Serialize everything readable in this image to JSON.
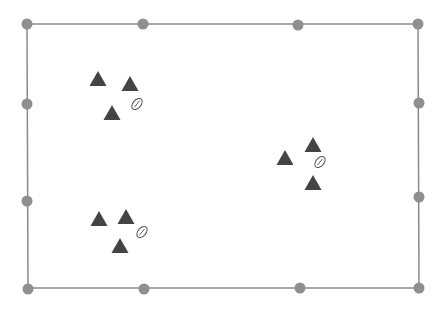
{
  "diagram": {
    "type": "field-formation-editor",
    "frame": {
      "border_color": "#8a8a8a",
      "handle_color": "#8f8f8f",
      "corners": [
        [
          27,
          24
        ],
        [
          418,
          24
        ],
        [
          419,
          288
        ],
        [
          28,
          288
        ]
      ],
      "handles": [
        {
          "x": 27,
          "y": 24,
          "pos": "top-left"
        },
        {
          "x": 143,
          "y": 24,
          "pos": "top"
        },
        {
          "x": 298,
          "y": 25,
          "pos": "top"
        },
        {
          "x": 418,
          "y": 24,
          "pos": "top-right"
        },
        {
          "x": 27,
          "y": 104,
          "pos": "left"
        },
        {
          "x": 27,
          "y": 201,
          "pos": "left"
        },
        {
          "x": 419,
          "y": 103,
          "pos": "right"
        },
        {
          "x": 419,
          "y": 197,
          "pos": "right"
        },
        {
          "x": 28,
          "y": 289,
          "pos": "bottom-left"
        },
        {
          "x": 144,
          "y": 289,
          "pos": "bottom"
        },
        {
          "x": 300,
          "y": 288,
          "pos": "bottom"
        },
        {
          "x": 419,
          "y": 288,
          "pos": "bottom-right"
        }
      ]
    },
    "groups": [
      {
        "name": "group-top-left",
        "players": [
          {
            "x": 98,
            "y": 79
          },
          {
            "x": 130,
            "y": 84
          },
          {
            "x": 112,
            "y": 113
          }
        ],
        "ball": {
          "x": 137,
          "y": 104
        }
      },
      {
        "name": "group-right",
        "players": [
          {
            "x": 285,
            "y": 158
          },
          {
            "x": 313,
            "y": 145
          },
          {
            "x": 313,
            "y": 183
          }
        ],
        "ball": {
          "x": 320,
          "y": 162
        }
      },
      {
        "name": "group-bottom-left",
        "players": [
          {
            "x": 99,
            "y": 219
          },
          {
            "x": 126,
            "y": 217
          },
          {
            "x": 120,
            "y": 246
          }
        ],
        "ball": {
          "x": 142,
          "y": 232
        }
      }
    ],
    "player_color": "#444444",
    "ball_color": "#555555",
    "icons": {
      "player": "triangle-marker-icon",
      "ball": "football-icon",
      "handle": "resize-handle-icon"
    }
  }
}
